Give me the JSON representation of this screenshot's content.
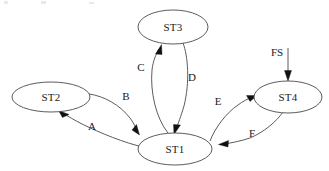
{
  "diagram": {
    "type": "state-transition-diagram",
    "title": "",
    "background_color": "#ffffff",
    "node_stroke_color": "#4a4a4a",
    "edge_stroke_color": "#4a4a4a",
    "arrow_color": "#111111",
    "text_color": "#1a1a1a",
    "nodes": [
      {
        "id": "ST1",
        "label": "ST1",
        "cx": 175,
        "cy": 149,
        "rx": 37,
        "ry": 16
      },
      {
        "id": "ST2",
        "label": "ST2",
        "cx": 51,
        "cy": 97,
        "rx": 39,
        "ry": 15
      },
      {
        "id": "ST3",
        "label": "ST3",
        "cx": 173,
        "cy": 27,
        "rx": 35,
        "ry": 17
      },
      {
        "id": "ST4",
        "label": "ST4",
        "cx": 288,
        "cy": 97,
        "rx": 34,
        "ry": 16
      }
    ],
    "edges": [
      {
        "id": "A",
        "label": "A",
        "from": "ST1",
        "to": "ST2",
        "label_x": 92,
        "label_y": 130
      },
      {
        "id": "B",
        "label": "B",
        "from": "ST2",
        "to": "ST1",
        "label_x": 126,
        "label_y": 100
      },
      {
        "id": "C",
        "label": "C",
        "from": "ST1",
        "to": "ST3",
        "label_x": 141,
        "label_y": 71
      },
      {
        "id": "D",
        "label": "D",
        "from": "ST3",
        "to": "ST1",
        "label_x": 192,
        "label_y": 81
      },
      {
        "id": "E",
        "label": "E",
        "from": "ST1",
        "to": "ST4",
        "label_x": 218,
        "label_y": 105
      },
      {
        "id": "F",
        "label": "F",
        "from": "ST4",
        "to": "ST1",
        "label_x": 252,
        "label_y": 137
      },
      {
        "id": "FS",
        "label": "FS",
        "from": "start",
        "to": "ST4",
        "label_x": 277,
        "label_y": 56
      }
    ]
  }
}
